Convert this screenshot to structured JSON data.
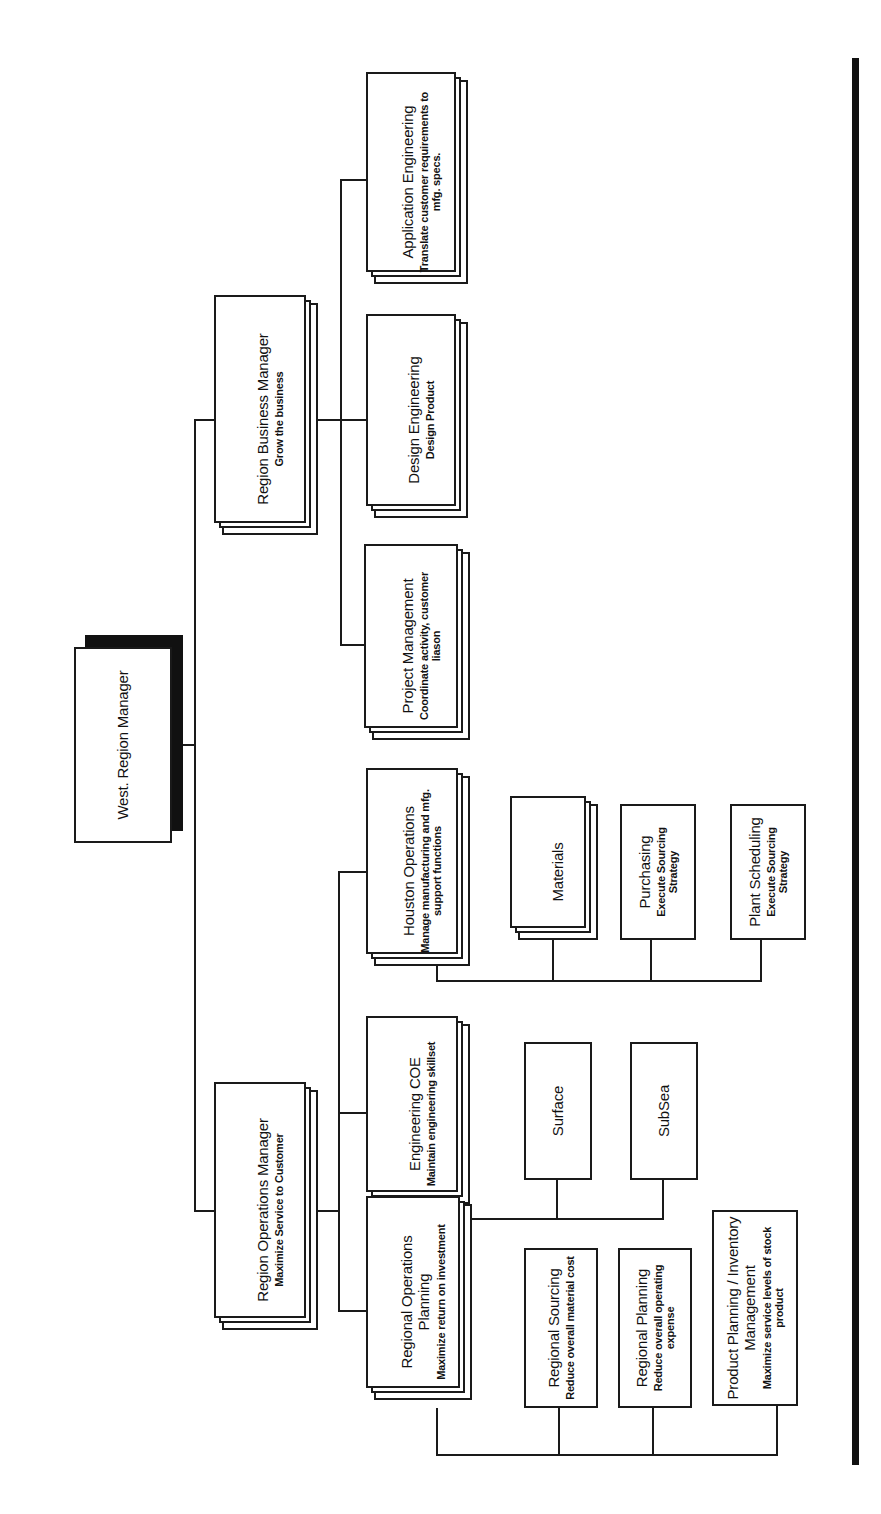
{
  "diagram": {
    "type": "organization-chart",
    "orientation": "rotated-90-ccw",
    "root": {
      "id": "west-region-manager",
      "title": "West. Region Manager",
      "subtitle": ""
    },
    "nodes": [
      {
        "id": "region-business-manager",
        "title": "Region Business Manager",
        "subtitle": "Grow the business",
        "parent": "west-region-manager",
        "stacked": true
      },
      {
        "id": "region-operations-manager",
        "title": "Region Operations Manager",
        "subtitle": "Maximize Service to Customer",
        "parent": "west-region-manager",
        "stacked": true
      },
      {
        "id": "application-engineering",
        "title": "Application Engineering",
        "subtitle": "Translate customer requirements to mfg. specs.",
        "parent": "region-business-manager",
        "stacked": true
      },
      {
        "id": "design-engineering",
        "title": "Design Engineering",
        "subtitle": "Design Product",
        "parent": "region-business-manager",
        "stacked": true
      },
      {
        "id": "project-management",
        "title": "Project Management",
        "subtitle": "Coordinate activity, customer liason",
        "parent": "region-business-manager",
        "stacked": true
      },
      {
        "id": "houston-operations",
        "title": "Houston Operations",
        "subtitle": "Manage manufacturing and mfg. support functions",
        "parent": "region-operations-manager",
        "stacked": true
      },
      {
        "id": "engineering-coe",
        "title": "Engineering COE",
        "subtitle": "Maintain engineering skillset",
        "parent": "region-operations-manager",
        "stacked": true
      },
      {
        "id": "regional-operations-planning",
        "title": "Regional Operations Planning",
        "subtitle": "Maximize return on investment",
        "parent": "region-operations-manager",
        "stacked": true
      },
      {
        "id": "materials",
        "title": "Materials",
        "subtitle": "",
        "parent": "houston-operations",
        "stacked": true
      },
      {
        "id": "purchasing",
        "title": "Purchasing",
        "subtitle": "Execute Sourcing Strategy",
        "parent": "houston-operations",
        "stacked": false
      },
      {
        "id": "plant-scheduling",
        "title": "Plant Scheduling",
        "subtitle": "Execute Sourcing Strategy",
        "parent": "houston-operations",
        "stacked": false
      },
      {
        "id": "surface",
        "title": "Surface",
        "subtitle": "",
        "parent": "engineering-coe",
        "stacked": false
      },
      {
        "id": "subsea",
        "title": "SubSea",
        "subtitle": "",
        "parent": "engineering-coe",
        "stacked": false
      },
      {
        "id": "regional-sourcing",
        "title": "Regional Sourcing",
        "subtitle": "Reduce overall material cost",
        "parent": "regional-operations-planning",
        "stacked": false
      },
      {
        "id": "regional-planning",
        "title": "Regional Planning",
        "subtitle": "Reduce overall operating expense",
        "parent": "regional-operations-planning",
        "stacked": false
      },
      {
        "id": "product-planning-inventory-management",
        "title": "Product Planning / Inventory Management",
        "subtitle": "Maximize service levels of stock product",
        "parent": "regional-operations-planning",
        "stacked": false
      }
    ],
    "colors": {
      "stroke": "#1a1a1a",
      "fill": "#ffffff",
      "shadow": "#111111",
      "text": "#111111"
    }
  }
}
